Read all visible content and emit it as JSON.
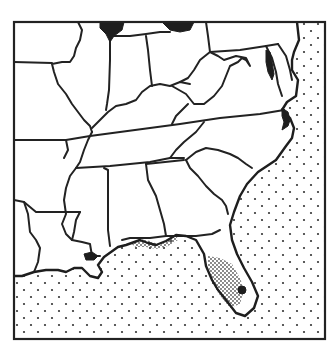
{
  "map": {
    "title": "",
    "region": "Southeastern United States",
    "colors": {
      "background": "#ffffff",
      "outline": "#222222",
      "ocean_stipple": "#333333",
      "dense_stipple": "#555555",
      "water_bodies": "#1e1e1e"
    },
    "layers": [
      {
        "name": "ocean",
        "pattern": "sparse-dot-stipple",
        "covers": [
          "Atlantic Ocean",
          "Gulf of Mexico"
        ]
      },
      {
        "name": "highlighted-range",
        "pattern": "dense-dot-stipple",
        "covers": [
          "Florida panhandle coast",
          "central peninsular Florida"
        ]
      },
      {
        "name": "water-bodies",
        "pattern": "solid-black",
        "covers": [
          "Lake Michigan",
          "Lake Erie",
          "Chesapeake Bay",
          "Pamlico Sound",
          "Lake Pontchartrain",
          "Lake Okeechobee"
        ]
      }
    ],
    "legend": [],
    "labels": []
  }
}
